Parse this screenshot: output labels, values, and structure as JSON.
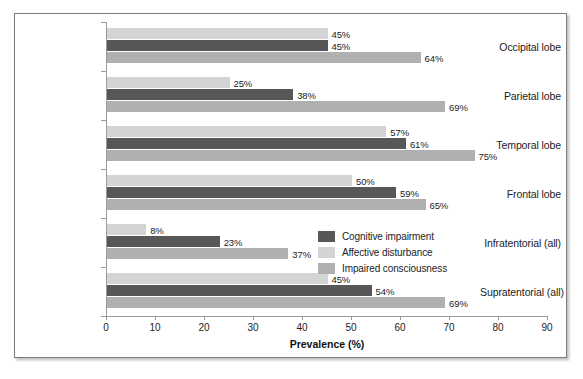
{
  "chart_data": {
    "type": "bar",
    "orientation": "horizontal",
    "title": "",
    "xlabel": "Prevalence (%)",
    "ylabel": "",
    "xlim": [
      0,
      90
    ],
    "xticks": [
      0,
      10,
      20,
      30,
      40,
      50,
      60,
      70,
      80,
      90
    ],
    "grid": false,
    "legend_position": "inside-right",
    "categories": [
      "Occipital lobe",
      "Parietal lobe",
      "Temporal lobe",
      "Frontal lobe",
      "Infratentorial (all)",
      "Supratentorial (all)"
    ],
    "series": [
      {
        "name": "Affective disturbance",
        "color": "#d4d4d4",
        "values": [
          45,
          25,
          57,
          50,
          8,
          45
        ],
        "labels": [
          "45%",
          "25%",
          "57%",
          "50%",
          "8%",
          "45%"
        ]
      },
      {
        "name": "Cognitive impairment",
        "color": "#575757",
        "values": [
          45,
          38,
          61,
          59,
          23,
          54
        ],
        "labels": [
          "45%",
          "38%",
          "61%",
          "59%",
          "23%",
          "54%"
        ]
      },
      {
        "name": "Impaired consciousness",
        "color": "#b0b0b0",
        "values": [
          64,
          69,
          75,
          65,
          37,
          69
        ],
        "labels": [
          "64%",
          "69%",
          "75%",
          "65%",
          "37%",
          "69%"
        ]
      }
    ],
    "legend_order": [
      "Cognitive impairment",
      "Affective disturbance",
      "Impaired consciousness"
    ]
  },
  "legend": {
    "items": [
      {
        "label": "Cognitive impairment",
        "color": "#575757"
      },
      {
        "label": "Affective disturbance",
        "color": "#d4d4d4"
      },
      {
        "label": "Impaired consciousness",
        "color": "#b0b0b0"
      }
    ]
  },
  "axis": {
    "x_title": "Prevalence (%)",
    "x_tick_labels": [
      "0",
      "10",
      "20",
      "30",
      "40",
      "50",
      "60",
      "70",
      "80",
      "90"
    ]
  },
  "colors": {
    "cognitive_impairment": "#575757",
    "affective_disturbance": "#d4d4d4",
    "impaired_consciousness": "#b0b0b0",
    "axis_line": "#9a9a9a",
    "frame_border": "#7d7d7d",
    "text": "#1c1c1c"
  }
}
